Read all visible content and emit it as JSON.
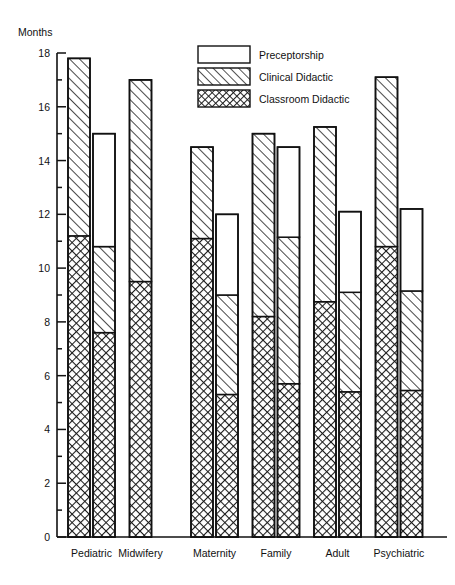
{
  "chart_data": {
    "type": "bar",
    "title": "",
    "subtitle": "",
    "xlabel": "",
    "ylabel": "Months",
    "ylim": [
      0,
      18
    ],
    "ytick_step": 2,
    "ytick_labels": [
      "0",
      "2",
      "4",
      "6",
      "8",
      "10",
      "12",
      "14",
      "16",
      "18"
    ],
    "grid": false,
    "stacked": true,
    "legend_position": "top-center",
    "categories": [
      "Pediatric",
      "Midwifery",
      "Maternity",
      "Family",
      "Adult",
      "Psychiatric"
    ],
    "legend": [
      {
        "name": "Preceptorship",
        "fill": "empty"
      },
      {
        "name": "Clinical Didactic",
        "fill": "diagonal-hatch"
      },
      {
        "name": "Classroom Didactic",
        "fill": "cross-hatch"
      }
    ],
    "series": [
      {
        "name": "Classroom Didactic",
        "fill": "cross-hatch"
      },
      {
        "name": "Clinical Didactic",
        "fill": "diagonal-hatch"
      },
      {
        "name": "Preceptorship",
        "fill": "empty"
      }
    ],
    "groups": [
      {
        "category": "Pediatric",
        "bars": [
          {
            "total": 17.8,
            "classroom": 11.2,
            "clinical": 6.6,
            "preceptorship": 0.0
          },
          {
            "total": 15.0,
            "classroom": 7.6,
            "clinical": 3.2,
            "preceptorship": 4.2
          }
        ]
      },
      {
        "category": "Midwifery",
        "bars": [
          {
            "total": 17.0,
            "classroom": 9.5,
            "clinical": 7.5,
            "preceptorship": 0.0
          }
        ]
      },
      {
        "category": "Maternity",
        "bars": [
          {
            "total": 14.5,
            "classroom": 11.1,
            "clinical": 3.4,
            "preceptorship": 0.0
          },
          {
            "total": 12.0,
            "classroom": 5.3,
            "clinical": 3.7,
            "preceptorship": 3.0
          }
        ]
      },
      {
        "category": "Family",
        "bars": [
          {
            "total": 15.0,
            "classroom": 8.2,
            "clinical": 6.8,
            "preceptorship": 0.0
          },
          {
            "total": 14.5,
            "classroom": 5.7,
            "clinical": 5.45,
            "preceptorship": 3.35
          }
        ]
      },
      {
        "category": "Adult",
        "bars": [
          {
            "total": 15.25,
            "classroom": 8.75,
            "clinical": 6.5,
            "preceptorship": 0.0
          },
          {
            "total": 12.1,
            "classroom": 5.4,
            "clinical": 3.7,
            "preceptorship": 3.0
          }
        ]
      },
      {
        "category": "Psychiatric",
        "bars": [
          {
            "total": 17.1,
            "classroom": 10.8,
            "clinical": 6.3,
            "preceptorship": 0.0
          },
          {
            "total": 12.2,
            "classroom": 5.45,
            "clinical": 3.7,
            "preceptorship": 3.05
          }
        ]
      }
    ]
  },
  "axis": {
    "y_title": "Months",
    "ticks": [
      "18",
      "16",
      "14",
      "12",
      "10",
      "8",
      "6",
      "4",
      "2",
      "0"
    ]
  },
  "legend": {
    "items": [
      {
        "label": "Preceptorship"
      },
      {
        "label": "Clinical Didactic"
      },
      {
        "label": "Classroom Didactic"
      }
    ]
  },
  "colors": {
    "stroke": "#111111",
    "background": "#ffffff",
    "hatch": "#222222"
  }
}
